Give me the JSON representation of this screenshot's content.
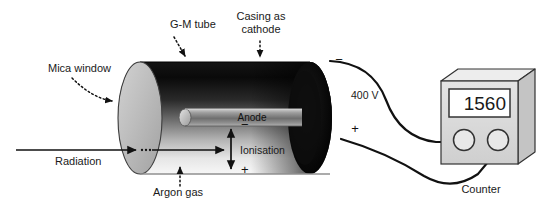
{
  "diagram": {
    "annotations": {
      "mica_window": "Mica window",
      "gm_tube": "G-M tube",
      "casing_line1": "Casing as",
      "casing_line2": "cathode",
      "argon_gas": "Argon gas",
      "radiation": "Radiation",
      "anode": "Anode",
      "ionisation": "Ionisation",
      "counter": "Counter"
    },
    "electrical": {
      "voltage": "400 V",
      "negative_sign": "−",
      "positive_sign": "+",
      "ion_negative": "−",
      "ion_positive": "+"
    },
    "counter_display": {
      "value": "1560"
    },
    "colors": {
      "background": "#ffffff",
      "text": "#1a1a1a",
      "tube_dark": "#050505",
      "tube_mid": "#4a4a4a",
      "tube_light": "#f2f2f2",
      "mica_window_fill": "#b9b9b9",
      "cathode_cap": "#000000",
      "anode_rod": "#8a8a8a",
      "counter_body": "#d8d8d8",
      "counter_top": "#eaeaea",
      "counter_screen": "#ffffff",
      "wire": "#111111",
      "baseline": "#8f8f8f"
    }
  }
}
